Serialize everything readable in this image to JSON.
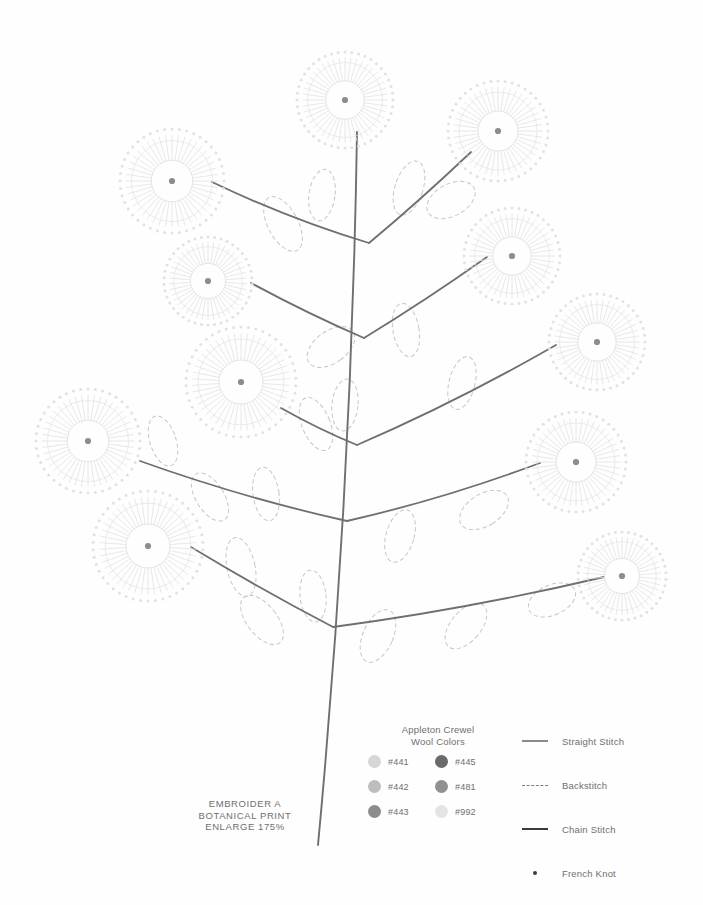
{
  "page": {
    "background": "#fefefe",
    "width": 703,
    "height": 905
  },
  "caption": {
    "text": "EMBROIDER A\nBOTANICAL PRINT\nENLARGE 175%"
  },
  "legend_colors": {
    "title": "Appleton Crewel\nWool Colors",
    "swatches": [
      {
        "code": "#441",
        "color": "#d6d6d6"
      },
      {
        "code": "#442",
        "color": "#bdbdbd"
      },
      {
        "code": "#443",
        "color": "#8c8c8c"
      },
      {
        "code": "#445",
        "color": "#6a6a6a"
      },
      {
        "code": "#481",
        "color": "#909090"
      },
      {
        "code": "#992",
        "color": "#e4e4e4"
      }
    ]
  },
  "legend_stitches": {
    "items": [
      {
        "label": "Straight Stitch",
        "symbol": "solid-thin-line",
        "color": "#8a8a8a"
      },
      {
        "label": "Backstitch",
        "symbol": "dashed-line",
        "color": "#7d7d7d"
      },
      {
        "label": "Chain Stitch",
        "symbol": "solid-thick-line",
        "color": "#3a3a3a"
      },
      {
        "label": "French Knot",
        "symbol": "dot",
        "color": "#3a3a3a"
      }
    ]
  },
  "artwork": {
    "description": "Botanical embroidery transfer pattern: a tall central stem with paired branches, dashed leaf outlines and radial starburst flowers",
    "stem_color": "#6f6f6f",
    "branch_color": "#6f6f6f",
    "leaf_color": "#c6c6c6",
    "flower_line_color": "#e2e2e2",
    "flower_center_color": "#8d8d8d",
    "stem": {
      "x_top": 357,
      "y_top": 132,
      "x_bottom": 318,
      "y_bottom": 845
    },
    "branches": [
      {
        "from_x": 369,
        "from_y": 243,
        "to_x": 212,
        "to_y": 182,
        "side": "left"
      },
      {
        "from_x": 369,
        "from_y": 243,
        "to_x": 471,
        "to_y": 152,
        "side": "right"
      },
      {
        "from_x": 364,
        "from_y": 338,
        "to_x": 251,
        "to_y": 283,
        "side": "left"
      },
      {
        "from_x": 364,
        "from_y": 338,
        "to_x": 487,
        "to_y": 257,
        "side": "right"
      },
      {
        "from_x": 357,
        "from_y": 445,
        "to_x": 281,
        "to_y": 408,
        "side": "left"
      },
      {
        "from_x": 357,
        "from_y": 445,
        "to_x": 556,
        "to_y": 345,
        "side": "right"
      },
      {
        "from_x": 347,
        "from_y": 521,
        "to_x": 140,
        "to_y": 461,
        "side": "left"
      },
      {
        "from_x": 347,
        "from_y": 521,
        "to_x": 540,
        "to_y": 463,
        "side": "right"
      },
      {
        "from_x": 333,
        "from_y": 627,
        "to_x": 191,
        "to_y": 547,
        "side": "left"
      },
      {
        "from_x": 333,
        "from_y": 627,
        "to_x": 604,
        "to_y": 577,
        "side": "right"
      }
    ],
    "flowers": [
      {
        "cx": 345,
        "cy": 100,
        "r": 48,
        "rays": 44
      },
      {
        "cx": 498,
        "cy": 131,
        "r": 50,
        "rays": 44
      },
      {
        "cx": 172,
        "cy": 181,
        "r": 52,
        "rays": 44
      },
      {
        "cx": 208,
        "cy": 281,
        "r": 44,
        "rays": 42
      },
      {
        "cx": 512,
        "cy": 256,
        "r": 48,
        "rays": 44
      },
      {
        "cx": 241,
        "cy": 382,
        "r": 55,
        "rays": 46
      },
      {
        "cx": 597,
        "cy": 342,
        "r": 48,
        "rays": 44
      },
      {
        "cx": 88,
        "cy": 441,
        "r": 52,
        "rays": 44
      },
      {
        "cx": 576,
        "cy": 462,
        "r": 50,
        "rays": 44
      },
      {
        "cx": 148,
        "cy": 546,
        "r": 55,
        "rays": 46
      },
      {
        "cx": 622,
        "cy": 576,
        "r": 44,
        "rays": 42
      }
    ],
    "leaves": [
      {
        "cx": 283,
        "cy": 224,
        "rx": 15,
        "ry": 30,
        "rot": -28
      },
      {
        "cx": 322,
        "cy": 195,
        "rx": 13,
        "ry": 26,
        "rot": 8
      },
      {
        "cx": 409,
        "cy": 188,
        "rx": 14,
        "ry": 28,
        "rot": 18
      },
      {
        "cx": 451,
        "cy": 200,
        "rx": 16,
        "ry": 26,
        "rot": 62
      },
      {
        "cx": 406,
        "cy": 330,
        "rx": 13,
        "ry": 27,
        "rot": -10
      },
      {
        "cx": 331,
        "cy": 347,
        "rx": 16,
        "ry": 27,
        "rot": 54
      },
      {
        "cx": 462,
        "cy": 383,
        "rx": 13,
        "ry": 27,
        "rot": 14
      },
      {
        "cx": 163,
        "cy": 441,
        "rx": 13,
        "ry": 26,
        "rot": -18
      },
      {
        "cx": 316,
        "cy": 424,
        "rx": 14,
        "ry": 28,
        "rot": -22
      },
      {
        "cx": 345,
        "cy": 405,
        "rx": 13,
        "ry": 26,
        "rot": 6
      },
      {
        "cx": 210,
        "cy": 497,
        "rx": 14,
        "ry": 27,
        "rot": -32
      },
      {
        "cx": 266,
        "cy": 494,
        "rx": 13,
        "ry": 27,
        "rot": -8
      },
      {
        "cx": 400,
        "cy": 536,
        "rx": 14,
        "ry": 27,
        "rot": 16
      },
      {
        "cx": 484,
        "cy": 510,
        "rx": 16,
        "ry": 27,
        "rot": 58
      },
      {
        "cx": 241,
        "cy": 567,
        "rx": 14,
        "ry": 30,
        "rot": -12
      },
      {
        "cx": 262,
        "cy": 620,
        "rx": 15,
        "ry": 29,
        "rot": -38
      },
      {
        "cx": 313,
        "cy": 596,
        "rx": 13,
        "ry": 26,
        "rot": -6
      },
      {
        "cx": 378,
        "cy": 636,
        "rx": 15,
        "ry": 28,
        "rot": 24
      },
      {
        "cx": 466,
        "cy": 626,
        "rx": 15,
        "ry": 27,
        "rot": 40
      },
      {
        "cx": 552,
        "cy": 600,
        "rx": 15,
        "ry": 25,
        "rot": 66
      }
    ]
  }
}
